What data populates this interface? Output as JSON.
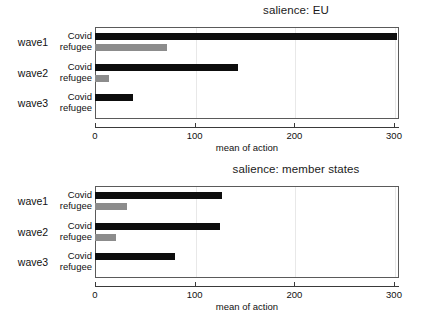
{
  "figure": {
    "background": "#ffffff",
    "covid_color": "#0d0d0d",
    "refugee_color": "#8c8c8c"
  },
  "panels": [
    {
      "id": "eu",
      "title": "salience: EU",
      "xlabel": "mean of action",
      "group_labels": [
        "wave1",
        "wave2",
        "wave3"
      ],
      "series_labels": [
        "Covid",
        "refugee"
      ],
      "tick_labels": [
        "0",
        "100",
        "200",
        "300"
      ]
    },
    {
      "id": "member-states",
      "title": "salience: member states",
      "xlabel": "mean of action",
      "group_labels": [
        "wave1",
        "wave2",
        "wave3"
      ],
      "series_labels": [
        "Covid",
        "refugee"
      ],
      "tick_labels": [
        "0",
        "100",
        "200",
        "300"
      ]
    }
  ],
  "chart_data": [
    {
      "type": "bar",
      "orientation": "horizontal",
      "title": "salience: EU",
      "xlabel": "mean of action",
      "ylabel": "",
      "categories": [
        "wave1",
        "wave2",
        "wave3"
      ],
      "series": [
        {
          "name": "Covid",
          "color": "#0d0d0d",
          "values": [
            303,
            143,
            38
          ]
        },
        {
          "name": "refugee",
          "color": "#8c8c8c",
          "values": [
            72,
            14,
            0
          ]
        }
      ],
      "xlim": [
        0,
        305
      ],
      "xticks": [
        0,
        100,
        200,
        300
      ],
      "grid": true,
      "legend": "none"
    },
    {
      "type": "bar",
      "orientation": "horizontal",
      "title": "salience: member states",
      "xlabel": "mean of action",
      "ylabel": "",
      "categories": [
        "wave1",
        "wave2",
        "wave3"
      ],
      "series": [
        {
          "name": "Covid",
          "color": "#0d0d0d",
          "values": [
            127,
            125,
            80
          ]
        },
        {
          "name": "refugee",
          "color": "#8c8c8c",
          "values": [
            32,
            21,
            0
          ]
        }
      ],
      "xlim": [
        0,
        305
      ],
      "xticks": [
        0,
        100,
        200,
        300
      ],
      "grid": true,
      "legend": "none"
    }
  ]
}
